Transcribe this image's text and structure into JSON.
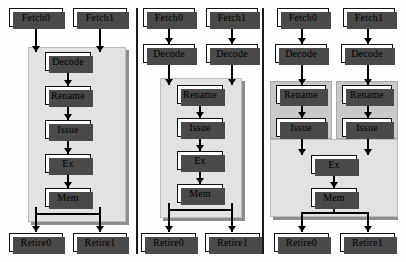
{
  "figure": {
    "type": "block-diagram",
    "panel_count": 3
  },
  "labels": {
    "fetch0": "Fetch0",
    "fetch1": "Fetch1",
    "decode": "Decode",
    "rename": "Rename",
    "issue": "Issue",
    "ex": "Ex",
    "mem": "Mem",
    "retire0": "Retire0",
    "retire1": "Retire1"
  },
  "colors": {
    "box_fill": "#ffffff",
    "box_border": "#111111",
    "box_shadow": "#4a4a4a",
    "shared_region_light": "#e2e2e2",
    "shared_region_dark": "#c9c9c9",
    "divider": "#1a1a1a",
    "background": "#ffffff"
  },
  "panels": [
    {
      "id": "panel-left",
      "name": "shared-from-decode",
      "private_stages": [
        "Fetch0",
        "Fetch1"
      ],
      "shared_stages": [
        "Decode",
        "Rename",
        "Issue",
        "Ex",
        "Mem"
      ],
      "exit_stages": [
        "Retire0",
        "Retire1"
      ],
      "shared_regions": 1
    },
    {
      "id": "panel-middle",
      "name": "shared-from-rename",
      "private_stages": [
        "Fetch0",
        "Decode",
        "Fetch1",
        "Decode"
      ],
      "shared_stages": [
        "Rename",
        "Issue",
        "Ex",
        "Mem"
      ],
      "exit_stages": [
        "Retire0",
        "Retire1"
      ],
      "shared_regions": 1
    },
    {
      "id": "panel-right",
      "name": "shared-from-ex",
      "private_stages": [
        "Fetch0",
        "Decode",
        "Rename",
        "Issue",
        "Fetch1",
        "Decode",
        "Rename",
        "Issue"
      ],
      "shared_stages": [
        "Ex",
        "Mem"
      ],
      "exit_stages": [
        "Retire0",
        "Retire1"
      ],
      "shared_regions": 3
    }
  ]
}
